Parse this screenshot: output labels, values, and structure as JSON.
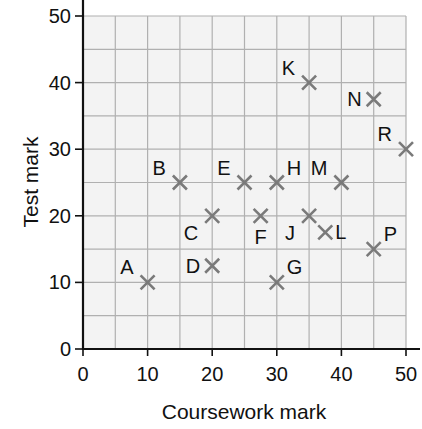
{
  "chart_data": {
    "type": "scatter",
    "title": "",
    "xlabel": "Coursework mark",
    "ylabel": "Test mark",
    "xlim": [
      0,
      50
    ],
    "ylim": [
      0,
      50
    ],
    "x_ticks": [
      0,
      10,
      20,
      30,
      40,
      50
    ],
    "y_ticks": [
      0,
      10,
      20,
      30,
      40,
      50
    ],
    "grid": true,
    "grid_step": 5,
    "legend": null,
    "marker": "x",
    "colors": {
      "marker": "#7a7a7a",
      "grid": "#b0b0b0",
      "plot_bg": "#f3f3f3",
      "axis": "#111111"
    },
    "points": [
      {
        "label": "A",
        "x": 10,
        "y": 10,
        "label_pos": "tl"
      },
      {
        "label": "B",
        "x": 15,
        "y": 25,
        "label_pos": "tl"
      },
      {
        "label": "C",
        "x": 20,
        "y": 20,
        "label_pos": "bl"
      },
      {
        "label": "D",
        "x": 20,
        "y": 12.5,
        "label_pos": "l"
      },
      {
        "label": "E",
        "x": 25,
        "y": 25,
        "label_pos": "tl"
      },
      {
        "label": "F",
        "x": 27.5,
        "y": 20,
        "label_pos": "b"
      },
      {
        "label": "G",
        "x": 30,
        "y": 10,
        "label_pos": "tr"
      },
      {
        "label": "H",
        "x": 30,
        "y": 25,
        "label_pos": "tr"
      },
      {
        "label": "J",
        "x": 35,
        "y": 20,
        "label_pos": "bl"
      },
      {
        "label": "K",
        "x": 35,
        "y": 40,
        "label_pos": "tl"
      },
      {
        "label": "L",
        "x": 37.5,
        "y": 17.5,
        "label_pos": "r"
      },
      {
        "label": "M",
        "x": 40,
        "y": 25,
        "label_pos": "tl"
      },
      {
        "label": "N",
        "x": 45,
        "y": 37.5,
        "label_pos": "l"
      },
      {
        "label": "P",
        "x": 45,
        "y": 15,
        "label_pos": "tr"
      },
      {
        "label": "R",
        "x": 50,
        "y": 30,
        "label_pos": "tl"
      }
    ]
  }
}
